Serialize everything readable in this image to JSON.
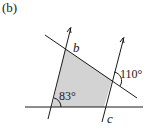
{
  "figure": {
    "part_label": "(b)",
    "labels": {
      "b": "b",
      "c": "c",
      "angle_110": "110°",
      "angle_83": "83°"
    },
    "colors": {
      "line": "#1a1a1a",
      "shade": "#d3d3d3"
    }
  }
}
